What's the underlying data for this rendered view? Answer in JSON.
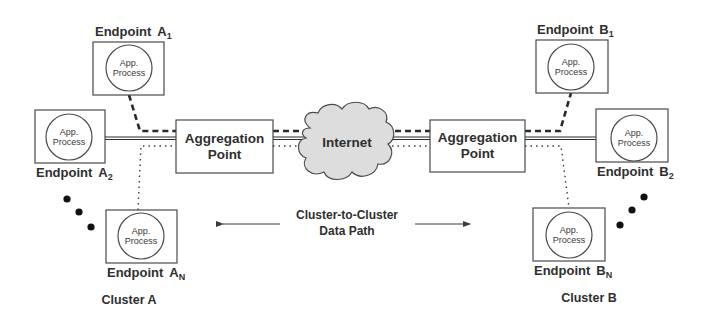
{
  "diagram": {
    "title": "Cluster-to-Cluster Data Path",
    "colors": {
      "stroke": "#4a4a4a",
      "text": "#2f2f2f",
      "cloud_fill": "#dddddd",
      "background": "#ffffff"
    },
    "clusters": [
      {
        "label": "Cluster A",
        "aggregation_point": {
          "line1": "Aggregation",
          "line2": "Point"
        },
        "endpoints": [
          {
            "name": "Endpoint",
            "letter": "A",
            "sub": "1",
            "process_line1": "App.",
            "process_line2": "Process",
            "link": "dashed"
          },
          {
            "name": "Endpoint",
            "letter": "A",
            "sub": "2",
            "process_line1": "App.",
            "process_line2": "Process",
            "link": "solid"
          },
          {
            "name": "Endpoint",
            "letter": "A",
            "sub": "N",
            "process_line1": "App.",
            "process_line2": "Process",
            "link": "dotted"
          }
        ],
        "ellipsis": "•••"
      },
      {
        "label": "Cluster B",
        "aggregation_point": {
          "line1": "Aggregation",
          "line2": "Point"
        },
        "endpoints": [
          {
            "name": "Endpoint",
            "letter": "B",
            "sub": "1",
            "process_line1": "App.",
            "process_line2": "Process",
            "link": "dashed"
          },
          {
            "name": "Endpoint",
            "letter": "B",
            "sub": "2",
            "process_line1": "App.",
            "process_line2": "Process",
            "link": "solid"
          },
          {
            "name": "Endpoint",
            "letter": "B",
            "sub": "N",
            "process_line1": "App.",
            "process_line2": "Process",
            "link": "dotted"
          }
        ],
        "ellipsis": "•••"
      }
    ],
    "network": {
      "label": "Internet"
    },
    "data_path": {
      "line1": "Cluster-to-Cluster",
      "line2": "Data Path"
    }
  }
}
